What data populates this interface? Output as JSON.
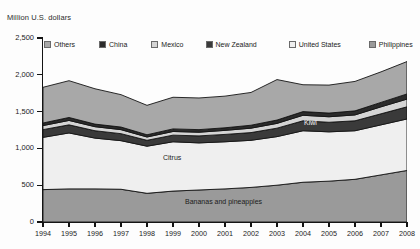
{
  "chart": {
    "axis_title": "Million U.S. dollars",
    "y_labels": [
      "2,500",
      "2,000",
      "1,500",
      "1,000",
      "500",
      "0"
    ],
    "x_labels": [
      "1994",
      "1995",
      "1996",
      "1997",
      "1998",
      "1999",
      "2000",
      "2001",
      "2002",
      "2003",
      "2004",
      "2005",
      "2006",
      "2007",
      "2008"
    ],
    "legend": [
      {
        "label": "Others",
        "color": "#a8a8a8"
      },
      {
        "label": "China",
        "color": "#2b2b2b"
      },
      {
        "label": "Mexico",
        "color": "#d4d4d4"
      },
      {
        "label": "New Zealand",
        "color": "#3a3a3a"
      },
      {
        "label": "United States",
        "color": "#efefef"
      },
      {
        "label": "Philippines",
        "color": "#9a9a9a"
      }
    ],
    "annotations": [
      {
        "text": "Kiwi",
        "x": 304,
        "y": 119,
        "style": "light"
      },
      {
        "text": "Citrus",
        "x": 163,
        "y": 154,
        "style": "dark"
      },
      {
        "text": "Bananas and pineapples",
        "x": 185,
        "y": 198,
        "style": "dark"
      }
    ]
  },
  "chart_data": {
    "type": "area",
    "title": "",
    "subtitle": "",
    "xlabel": "",
    "ylabel": "Million U.S. dollars",
    "ylim": [
      0,
      2500
    ],
    "grid": false,
    "legend_position": "top",
    "stacked": true,
    "x": [
      1994,
      1995,
      1996,
      1997,
      1998,
      1999,
      2000,
      2001,
      2002,
      2003,
      2004,
      2005,
      2006,
      2007,
      2008
    ],
    "categories": [
      "1994",
      "1995",
      "1996",
      "1997",
      "1998",
      "1999",
      "2000",
      "2001",
      "2002",
      "2003",
      "2004",
      "2005",
      "2006",
      "2007",
      "2008"
    ],
    "series": [
      {
        "name": "Philippines",
        "color": "#9a9a9a",
        "values": [
          440,
          450,
          450,
          445,
          390,
          420,
          435,
          450,
          470,
          500,
          540,
          555,
          580,
          640,
          700
        ]
      },
      {
        "name": "United States",
        "color": "#efefef",
        "values": [
          710,
          760,
          690,
          660,
          640,
          670,
          640,
          640,
          640,
          660,
          700,
          670,
          660,
          680,
          700
        ]
      },
      {
        "name": "New Zealand",
        "color": "#3a3a3a",
        "values": [
          105,
          110,
          100,
          95,
          80,
          90,
          95,
          100,
          105,
          115,
          135,
          130,
          135,
          150,
          165
        ]
      },
      {
        "name": "Mexico",
        "color": "#d4d4d4",
        "values": [
          55,
          60,
          55,
          55,
          45,
          50,
          50,
          55,
          60,
          65,
          75,
          75,
          80,
          95,
          105
        ]
      },
      {
        "name": "China",
        "color": "#2b2b2b",
        "values": [
          35,
          40,
          35,
          35,
          30,
          35,
          35,
          35,
          40,
          45,
          50,
          50,
          55,
          60,
          70
        ]
      },
      {
        "name": "Others",
        "color": "#a8a8a8",
        "values": [
          485,
          500,
          480,
          440,
          400,
          430,
          430,
          430,
          445,
          550,
          365,
          380,
          400,
          415,
          440
        ]
      }
    ],
    "totals": [
      1830,
      1920,
      1810,
      1730,
      1585,
      1695,
      1685,
      1710,
      1760,
      1935,
      1865,
      1860,
      1910,
      2040,
      2180
    ],
    "annotations": [
      "Kiwi",
      "Citrus",
      "Bananas and pineapples"
    ]
  }
}
